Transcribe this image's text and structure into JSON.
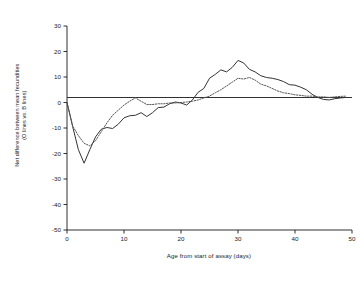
{
  "chart_data": {
    "type": "line",
    "title": "",
    "xlabel": "Age from start of assay (days)",
    "ylabel_line1": "Net difference between mean fecundities",
    "ylabel_line2": "(O lines vs. B lines)",
    "xlim": [
      0,
      50
    ],
    "ylim": [
      -50,
      30
    ],
    "xticks": [
      0,
      10,
      20,
      30,
      40,
      50
    ],
    "yticks": [
      30,
      20,
      10,
      0,
      -10,
      -20,
      -30,
      -40,
      -50
    ],
    "grid": false,
    "legend": "none",
    "zero_reference_line": 0,
    "series": [
      {
        "name": "solid-line",
        "style": "solid",
        "color": "#333333",
        "x": [
          0,
          1,
          2,
          3,
          4,
          5,
          6,
          7,
          8,
          9,
          10,
          11,
          12,
          13,
          14,
          15,
          16,
          17,
          18,
          19,
          20,
          21,
          22,
          23,
          24,
          25,
          26,
          27,
          28,
          29,
          30,
          31,
          32,
          33,
          34,
          35,
          36,
          37,
          38,
          39,
          40,
          41,
          42,
          43,
          44,
          45,
          46,
          47,
          48,
          49
        ],
        "values": [
          0,
          -9.5,
          -18.5,
          -23.8,
          -18.5,
          -13.5,
          -10.5,
          -9.8,
          -10.2,
          -8.5,
          -6.0,
          -5.2,
          -5.0,
          -4.0,
          -5.5,
          -4.0,
          -2.0,
          -1.8,
          -0.5,
          0.2,
          -0.2,
          -1.0,
          1.0,
          4.0,
          5.5,
          9.5,
          11.0,
          12.8,
          12.0,
          13.8,
          16.5,
          15.5,
          13.0,
          12.0,
          10.5,
          9.8,
          9.5,
          9.0,
          8.2,
          7.0,
          6.8,
          6.0,
          5.0,
          3.2,
          2.0,
          1.2,
          1.0,
          1.5,
          1.8,
          2.0
        ]
      },
      {
        "name": "dotted-line",
        "style": "dotted",
        "color": "#555555",
        "x": [
          0,
          1,
          2,
          3,
          4,
          5,
          6,
          7,
          8,
          9,
          10,
          11,
          12,
          13,
          14,
          15,
          16,
          17,
          18,
          19,
          20,
          21,
          22,
          23,
          24,
          25,
          26,
          27,
          28,
          29,
          30,
          31,
          32,
          33,
          34,
          35,
          36,
          37,
          38,
          39,
          40,
          41,
          42,
          43,
          44,
          45,
          46,
          47,
          48,
          49
        ],
        "values": [
          0,
          -9.2,
          -13.0,
          -16.0,
          -17.0,
          -15.0,
          -11.5,
          -8.0,
          -5.0,
          -3.0,
          -1.0,
          0.5,
          1.8,
          0.5,
          -0.8,
          -0.8,
          -0.5,
          -0.5,
          -0.2,
          -0.2,
          0.0,
          0.2,
          0.5,
          1.0,
          1.8,
          2.5,
          3.8,
          5.0,
          6.5,
          8.0,
          9.5,
          9.2,
          9.8,
          8.8,
          7.2,
          6.5,
          5.5,
          4.5,
          3.8,
          3.5,
          3.0,
          2.8,
          2.5,
          2.5,
          2.2,
          2.2,
          2.0,
          2.2,
          2.4,
          2.5
        ]
      }
    ]
  },
  "axes": {
    "x_tick_labels": [
      "0",
      "10",
      "20",
      "30",
      "40",
      "50"
    ],
    "y_tick_labels": [
      "30",
      "20",
      "10",
      "0",
      "-10",
      "-20",
      "-30",
      "-40",
      "-50"
    ]
  },
  "colors": {
    "axis": "#1a1a1a",
    "solid_series": "#333333",
    "dotted_series": "#555555",
    "background": "#ffffff"
  }
}
